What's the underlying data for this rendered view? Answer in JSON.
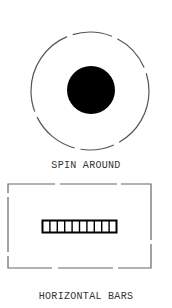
{
  "items": [
    {
      "label": "SPIN AROUND",
      "icon": "spin-around-icon",
      "shape": {
        "type": "dashed-circle-with-filled-disk",
        "outer_radius": 59,
        "inner_radius": 24
      }
    },
    {
      "label": "HORIZONTAL BARS",
      "icon": "horizontal-bars-icon",
      "shape": {
        "type": "dashed-rectangle-with-segmented-bar",
        "bar_cells": 10
      }
    }
  ],
  "colors": {
    "outline": "#555555",
    "fill": "#000000",
    "text": "#333333",
    "background": "#ffffff"
  }
}
